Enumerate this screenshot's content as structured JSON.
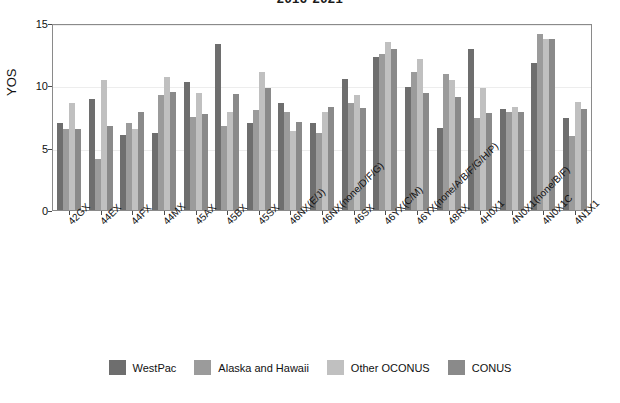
{
  "chart_data": {
    "type": "bar",
    "title": "2016-2021",
    "xlabel": "",
    "ylabel": "YOS",
    "ylim": [
      0,
      15
    ],
    "yticks": [
      0,
      5,
      10,
      15
    ],
    "grid": true,
    "legend_position": "bottom",
    "colors": {
      "WestPac": "#6e6e6e",
      "Alaska and Hawaii": "#9b9b9b",
      "Other OCONUS": "#c0c0c0",
      "CONUS": "#8a8a8a"
    },
    "categories": [
      "42GX",
      "44EX",
      "44FX",
      "44MX",
      "45AX",
      "45BX",
      "45SX",
      "46NX(E/J)",
      "46NX(none/D/F/G)",
      "46SX",
      "46YX(C/M)",
      "46YX(none/A/B/F/G/H/P)",
      "48RX",
      "4H0X1",
      "4N0X1(none/B/F)",
      "4N0X1C",
      "4N1X1"
    ],
    "series": [
      {
        "name": "WestPac",
        "values": [
          7.0,
          8.9,
          6.0,
          6.2,
          10.3,
          13.3,
          7.0,
          8.6,
          7.0,
          10.5,
          12.3,
          9.9,
          6.6,
          12.9,
          8.1,
          11.8,
          7.4
        ]
      },
      {
        "name": "Alaska and Hawaii",
        "values": [
          6.5,
          4.1,
          7.0,
          9.2,
          7.5,
          6.7,
          8.0,
          7.9,
          6.2,
          8.6,
          12.5,
          11.1,
          10.9,
          7.4,
          7.9,
          14.1,
          5.9
        ]
      },
      {
        "name": "Other OCONUS",
        "values": [
          8.6,
          10.4,
          6.5,
          10.7,
          9.4,
          7.9,
          11.1,
          6.3,
          7.9,
          9.2,
          13.5,
          12.1,
          10.4,
          9.8,
          8.3,
          13.7,
          8.7
        ]
      },
      {
        "name": "CONUS",
        "values": [
          6.5,
          6.7,
          7.9,
          9.5,
          7.7,
          9.3,
          9.8,
          7.1,
          8.3,
          8.2,
          12.9,
          9.4,
          9.1,
          7.8,
          7.9,
          13.7,
          8.1
        ]
      }
    ]
  },
  "legend": {
    "items": [
      {
        "label": "WestPac"
      },
      {
        "label": "Alaska and Hawaii"
      },
      {
        "label": "Other OCONUS"
      },
      {
        "label": "CONUS"
      }
    ]
  }
}
